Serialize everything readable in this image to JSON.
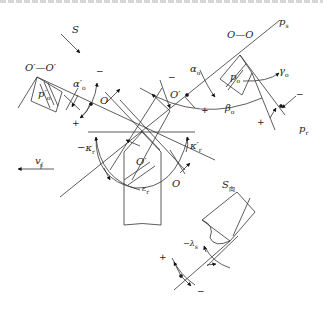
{
  "diagram": {
    "type": "turning-tool-angle-reference-diagram",
    "labels": {
      "S": "S",
      "section_left": "O′—O′",
      "section_right": "O—O",
      "alpha_o_prime": "α′",
      "alpha_o_prime_sub": "o",
      "p_o_prime": "p′",
      "p_o_prime_sub": "o",
      "O_left": "O",
      "O_prime_mid": "O′",
      "alpha_o": "α",
      "alpha_o_sub": "o",
      "p_o": "p",
      "p_o_sub": "o",
      "p_s": "p",
      "p_s_sub": "s",
      "gamma_o": "γ",
      "gamma_o_sub": "o",
      "beta_o": "β",
      "beta_o_sub": "o",
      "p_r": "p",
      "p_r_sub": "r",
      "kappa_r": "−κ",
      "kappa_r_sub": "r",
      "kappa_r_prime": "κ′",
      "kappa_r_prime_sub": "r",
      "v_f": "v",
      "v_f_sub": "f",
      "O_prime_center": "O′",
      "epsilon_r": "ε",
      "epsilon_r_sub": "r",
      "O_bottom": "O",
      "S_view": "S",
      "S_view_sub": "向",
      "lambda_s": "−λ",
      "lambda_s_sub": "s"
    },
    "signs": {
      "plus": "+",
      "minus": "−"
    }
  }
}
